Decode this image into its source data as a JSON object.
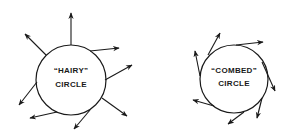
{
  "diagram": {
    "left": {
      "line1": "“HAIRY”",
      "line2": "CIRCLE",
      "cx": 71,
      "cy": 80,
      "r": 35
    },
    "right": {
      "line1": "“COMBED”",
      "line2": "CIRCLE",
      "cx": 234,
      "cy": 79,
      "r": 34
    },
    "stroke_color": "#1a1a1a",
    "background": "#ffffff"
  }
}
